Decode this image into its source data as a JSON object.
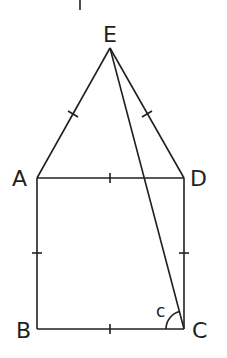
{
  "diagram": {
    "type": "geometry",
    "points": {
      "E": {
        "label": "E",
        "x": 110,
        "y": 48
      },
      "A": {
        "label": "A",
        "x": 37,
        "y": 178
      },
      "D": {
        "label": "D",
        "x": 184,
        "y": 178
      },
      "B": {
        "label": "B",
        "x": 37,
        "y": 329
      },
      "C": {
        "label": "C",
        "x": 184,
        "y": 329
      }
    },
    "segments": [
      "EA",
      "ED",
      "EC",
      "AD",
      "AB",
      "DC",
      "BC"
    ],
    "equal_marks": [
      "EA",
      "ED",
      "AD",
      "AB",
      "DC",
      "BC"
    ],
    "angle": {
      "label": "c",
      "vertex": "C",
      "between": [
        "CE",
        "CB"
      ]
    },
    "top_fragment": "|"
  },
  "colors": {
    "stroke": "#231f20",
    "background": "#ffffff"
  }
}
